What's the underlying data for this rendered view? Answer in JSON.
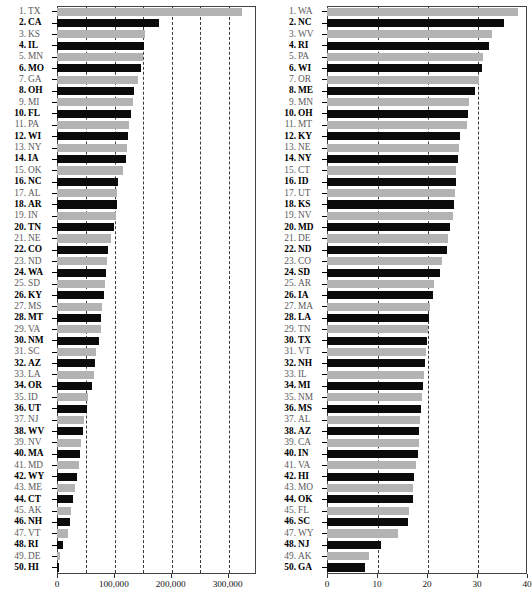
{
  "figure": {
    "panel_count": 2,
    "colors": {
      "gray_bar": "#b3b3b3",
      "black_bar": "#0b0b0b",
      "grid": "#3a3a3a",
      "frame": "#444444"
    }
  },
  "chart_data": [
    {
      "type": "bar",
      "orientation": "horizontal",
      "panel": "left",
      "title": "",
      "xlabel": "",
      "ylabel": "",
      "xlim": [
        0,
        350000
      ],
      "grid": true,
      "grid_style": "dashed-vertical",
      "gridlines": [
        50000,
        100000,
        150000,
        200000,
        250000,
        300000
      ],
      "tick_labels": [
        "0",
        "100,000",
        "200,000",
        "300,000"
      ],
      "tick_values": [
        0,
        100000,
        200000,
        300000
      ],
      "legend": "none",
      "categories": [
        "TX",
        "CA",
        "KS",
        "IL",
        "MN",
        "MO",
        "GA",
        "OH",
        "MI",
        "FL",
        "PA",
        "WI",
        "NY",
        "IA",
        "OK",
        "NC",
        "AL",
        "AR",
        "IN",
        "TN",
        "NE",
        "CO",
        "ND",
        "WA",
        "SD",
        "KY",
        "MS",
        "MT",
        "VA",
        "NM",
        "SC",
        "AZ",
        "LA",
        "OR",
        "ID",
        "UT",
        "NJ",
        "WV",
        "NV",
        "MA",
        "MD",
        "WY",
        "ME",
        "CT",
        "AK",
        "NH",
        "VT",
        "RI",
        "DE",
        "HI"
      ],
      "ranks": [
        1,
        2,
        3,
        4,
        5,
        6,
        7,
        8,
        9,
        10,
        11,
        12,
        13,
        14,
        15,
        16,
        17,
        18,
        19,
        20,
        21,
        22,
        23,
        24,
        25,
        26,
        27,
        28,
        29,
        30,
        31,
        32,
        33,
        34,
        35,
        36,
        37,
        38,
        39,
        40,
        41,
        42,
        43,
        44,
        45,
        46,
        47,
        48,
        49,
        50
      ],
      "values": [
        326000,
        179000,
        155000,
        153000,
        152000,
        148000,
        143000,
        136000,
        134000,
        130000,
        127000,
        125000,
        123000,
        121000,
        116000,
        107000,
        106000,
        105000,
        104000,
        101000,
        95000,
        90000,
        88000,
        87000,
        84000,
        82000,
        79000,
        78000,
        77000,
        73000,
        69000,
        67000,
        65000,
        62000,
        55000,
        52000,
        47000,
        45000,
        42000,
        41000,
        39000,
        36000,
        32000,
        28000,
        25000,
        23000,
        20000,
        10000,
        6000,
        4000
      ]
    },
    {
      "type": "bar",
      "orientation": "horizontal",
      "panel": "right",
      "title": "",
      "xlabel": "",
      "ylabel": "",
      "xlim": [
        0,
        40
      ],
      "grid": true,
      "grid_style": "dashed-vertical",
      "gridlines": [
        10,
        20,
        30
      ],
      "tick_labels": [
        "0",
        "10",
        "20",
        "30",
        "40"
      ],
      "tick_values": [
        0,
        10,
        20,
        30,
        40
      ],
      "legend": "none",
      "categories": [
        "WA",
        "NC",
        "WV",
        "RI",
        "PA",
        "WI",
        "OR",
        "ME",
        "MN",
        "OH",
        "MT",
        "KY",
        "NE",
        "NY",
        "CT",
        "ID",
        "UT",
        "KS",
        "NV",
        "MD",
        "DE",
        "ND",
        "CO",
        "SD",
        "AR",
        "IA",
        "MA",
        "LA",
        "TN",
        "TX",
        "VT",
        "NH",
        "IL",
        "MI",
        "NM",
        "MS",
        "AL",
        "AZ",
        "CA",
        "IN",
        "VA",
        "HI",
        "MO",
        "OK",
        "FL",
        "SC",
        "WY",
        "NJ",
        "AK",
        "GA"
      ],
      "ranks": [
        1,
        2,
        3,
        4,
        5,
        6,
        7,
        8,
        9,
        10,
        11,
        12,
        13,
        14,
        15,
        16,
        17,
        18,
        19,
        20,
        21,
        22,
        23,
        24,
        25,
        26,
        27,
        28,
        29,
        30,
        31,
        32,
        33,
        34,
        35,
        36,
        37,
        38,
        39,
        40,
        41,
        42,
        43,
        44,
        45,
        46,
        47,
        48,
        49,
        50
      ],
      "values": [
        38.2,
        35.4,
        33.0,
        32.4,
        31.2,
        31.0,
        30.3,
        29.6,
        28.4,
        28.2,
        28.0,
        26.6,
        26.4,
        26.2,
        25.8,
        25.7,
        25.6,
        25.4,
        25.2,
        24.6,
        24.2,
        24.0,
        23.0,
        22.6,
        21.4,
        21.2,
        20.6,
        20.4,
        20.2,
        20.0,
        19.8,
        19.6,
        19.4,
        19.2,
        19.0,
        18.8,
        18.6,
        18.4,
        18.3,
        18.2,
        17.8,
        17.4,
        17.2,
        17.1,
        16.4,
        16.2,
        14.2,
        10.8,
        8.4,
        7.6
      ]
    }
  ],
  "left_panel": {
    "axis_labels": [
      "0",
      "100,000",
      "200,000",
      "300,000"
    ],
    "rows": [
      {
        "rank": "1.",
        "abbr": "TX",
        "value": 326000
      },
      {
        "rank": "2.",
        "abbr": "CA",
        "value": 179000
      },
      {
        "rank": "3.",
        "abbr": "KS",
        "value": 155000
      },
      {
        "rank": "4.",
        "abbr": "IL",
        "value": 153000
      },
      {
        "rank": "5.",
        "abbr": "MN",
        "value": 152000
      },
      {
        "rank": "6.",
        "abbr": "MO",
        "value": 148000
      },
      {
        "rank": "7.",
        "abbr": "GA",
        "value": 143000
      },
      {
        "rank": "8.",
        "abbr": "OH",
        "value": 136000
      },
      {
        "rank": "9.",
        "abbr": "MI",
        "value": 134000
      },
      {
        "rank": "10.",
        "abbr": "FL",
        "value": 130000
      },
      {
        "rank": "11.",
        "abbr": "PA",
        "value": 127000
      },
      {
        "rank": "12.",
        "abbr": "WI",
        "value": 125000
      },
      {
        "rank": "13.",
        "abbr": "NY",
        "value": 123000
      },
      {
        "rank": "14.",
        "abbr": "IA",
        "value": 121000
      },
      {
        "rank": "15.",
        "abbr": "OK",
        "value": 116000
      },
      {
        "rank": "16.",
        "abbr": "NC",
        "value": 107000
      },
      {
        "rank": "17.",
        "abbr": "AL",
        "value": 106000
      },
      {
        "rank": "18.",
        "abbr": "AR",
        "value": 105000
      },
      {
        "rank": "19.",
        "abbr": "IN",
        "value": 104000
      },
      {
        "rank": "20.",
        "abbr": "TN",
        "value": 101000
      },
      {
        "rank": "21.",
        "abbr": "NE",
        "value": 95000
      },
      {
        "rank": "22.",
        "abbr": "CO",
        "value": 90000
      },
      {
        "rank": "23.",
        "abbr": "ND",
        "value": 88000
      },
      {
        "rank": "24.",
        "abbr": "WA",
        "value": 87000
      },
      {
        "rank": "25.",
        "abbr": "SD",
        "value": 84000
      },
      {
        "rank": "26.",
        "abbr": "KY",
        "value": 82000
      },
      {
        "rank": "27.",
        "abbr": "MS",
        "value": 79000
      },
      {
        "rank": "28.",
        "abbr": "MT",
        "value": 78000
      },
      {
        "rank": "29.",
        "abbr": "VA",
        "value": 77000
      },
      {
        "rank": "30.",
        "abbr": "NM",
        "value": 73000
      },
      {
        "rank": "31.",
        "abbr": "SC",
        "value": 69000
      },
      {
        "rank": "32.",
        "abbr": "AZ",
        "value": 67000
      },
      {
        "rank": "33.",
        "abbr": "LA",
        "value": 65000
      },
      {
        "rank": "34.",
        "abbr": "OR",
        "value": 62000
      },
      {
        "rank": "35.",
        "abbr": "ID",
        "value": 55000
      },
      {
        "rank": "36.",
        "abbr": "UT",
        "value": 52000
      },
      {
        "rank": "37.",
        "abbr": "NJ",
        "value": 47000
      },
      {
        "rank": "38.",
        "abbr": "WV",
        "value": 45000
      },
      {
        "rank": "39.",
        "abbr": "NV",
        "value": 42000
      },
      {
        "rank": "40.",
        "abbr": "MA",
        "value": 41000
      },
      {
        "rank": "41.",
        "abbr": "MD",
        "value": 39000
      },
      {
        "rank": "42.",
        "abbr": "WY",
        "value": 36000
      },
      {
        "rank": "43.",
        "abbr": "ME",
        "value": 32000
      },
      {
        "rank": "44.",
        "abbr": "CT",
        "value": 28000
      },
      {
        "rank": "45.",
        "abbr": "AK",
        "value": 25000
      },
      {
        "rank": "46.",
        "abbr": "NH",
        "value": 23000
      },
      {
        "rank": "47.",
        "abbr": "VT",
        "value": 20000
      },
      {
        "rank": "48.",
        "abbr": "RI",
        "value": 10000
      },
      {
        "rank": "49.",
        "abbr": "DE",
        "value": 6000
      },
      {
        "rank": "50.",
        "abbr": "HI",
        "value": 4000
      }
    ]
  },
  "right_panel": {
    "axis_labels": [
      "0",
      "10",
      "20",
      "30",
      "40"
    ],
    "rows": [
      {
        "rank": "1.",
        "abbr": "WA",
        "value": 38.2
      },
      {
        "rank": "2.",
        "abbr": "NC",
        "value": 35.4
      },
      {
        "rank": "3.",
        "abbr": "WV",
        "value": 33.0
      },
      {
        "rank": "4.",
        "abbr": "RI",
        "value": 32.4
      },
      {
        "rank": "5.",
        "abbr": "PA",
        "value": 31.2
      },
      {
        "rank": "6.",
        "abbr": "WI",
        "value": 31.0
      },
      {
        "rank": "7.",
        "abbr": "OR",
        "value": 30.3
      },
      {
        "rank": "8.",
        "abbr": "ME",
        "value": 29.6
      },
      {
        "rank": "9.",
        "abbr": "MN",
        "value": 28.4
      },
      {
        "rank": "10.",
        "abbr": "OH",
        "value": 28.2
      },
      {
        "rank": "11.",
        "abbr": "MT",
        "value": 28.0
      },
      {
        "rank": "12.",
        "abbr": "KY",
        "value": 26.6
      },
      {
        "rank": "13.",
        "abbr": "NE",
        "value": 26.4
      },
      {
        "rank": "14.",
        "abbr": "NY",
        "value": 26.2
      },
      {
        "rank": "15.",
        "abbr": "CT",
        "value": 25.8
      },
      {
        "rank": "16.",
        "abbr": "ID",
        "value": 25.7
      },
      {
        "rank": "17.",
        "abbr": "UT",
        "value": 25.6
      },
      {
        "rank": "18.",
        "abbr": "KS",
        "value": 25.4
      },
      {
        "rank": "19.",
        "abbr": "NV",
        "value": 25.2
      },
      {
        "rank": "20.",
        "abbr": "MD",
        "value": 24.6
      },
      {
        "rank": "21.",
        "abbr": "DE",
        "value": 24.2
      },
      {
        "rank": "22.",
        "abbr": "ND",
        "value": 24.0
      },
      {
        "rank": "23.",
        "abbr": "CO",
        "value": 23.0
      },
      {
        "rank": "24.",
        "abbr": "SD",
        "value": 22.6
      },
      {
        "rank": "25.",
        "abbr": "AR",
        "value": 21.4
      },
      {
        "rank": "26.",
        "abbr": "IA",
        "value": 21.2
      },
      {
        "rank": "27.",
        "abbr": "MA",
        "value": 20.6
      },
      {
        "rank": "28.",
        "abbr": "LA",
        "value": 20.4
      },
      {
        "rank": "29.",
        "abbr": "TN",
        "value": 20.2
      },
      {
        "rank": "30.",
        "abbr": "TX",
        "value": 20.0
      },
      {
        "rank": "31.",
        "abbr": "VT",
        "value": 19.8
      },
      {
        "rank": "32.",
        "abbr": "NH",
        "value": 19.6
      },
      {
        "rank": "33.",
        "abbr": "IL",
        "value": 19.4
      },
      {
        "rank": "34.",
        "abbr": "MI",
        "value": 19.2
      },
      {
        "rank": "35.",
        "abbr": "NM",
        "value": 19.0
      },
      {
        "rank": "36.",
        "abbr": "MS",
        "value": 18.8
      },
      {
        "rank": "37.",
        "abbr": "AL",
        "value": 18.6
      },
      {
        "rank": "38.",
        "abbr": "AZ",
        "value": 18.4
      },
      {
        "rank": "39.",
        "abbr": "CA",
        "value": 18.3
      },
      {
        "rank": "40.",
        "abbr": "IN",
        "value": 18.2
      },
      {
        "rank": "41.",
        "abbr": "VA",
        "value": 17.8
      },
      {
        "rank": "42.",
        "abbr": "HI",
        "value": 17.4
      },
      {
        "rank": "43.",
        "abbr": "MO",
        "value": 17.2
      },
      {
        "rank": "44.",
        "abbr": "OK",
        "value": 17.1
      },
      {
        "rank": "45.",
        "abbr": "FL",
        "value": 16.4
      },
      {
        "rank": "46.",
        "abbr": "SC",
        "value": 16.2
      },
      {
        "rank": "47.",
        "abbr": "WY",
        "value": 14.2
      },
      {
        "rank": "48.",
        "abbr": "NJ",
        "value": 10.8
      },
      {
        "rank": "49.",
        "abbr": "AK",
        "value": 8.4
      },
      {
        "rank": "50.",
        "abbr": "GA",
        "value": 7.6
      }
    ]
  }
}
